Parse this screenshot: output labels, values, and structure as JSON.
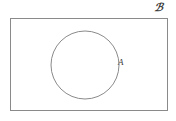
{
  "figure": {
    "type": "venn-diagram",
    "title": "",
    "background_color": "#ffffff",
    "stroke_color": "#8a8a8a",
    "label_color": "#3a3a3a"
  },
  "universe": {
    "name": "universal-set",
    "label": "ℬ",
    "label_plain": "U",
    "shape": "rectangle",
    "x": 10,
    "y": 18,
    "width": 157,
    "height": 92,
    "label_position": "top-right-outside"
  },
  "sets": [
    {
      "name": "set-a",
      "label": "A",
      "shape": "circle",
      "cx": 85,
      "cy": 65,
      "r": 34,
      "label_position": "right-outside",
      "label_x": 118,
      "label_y": 58,
      "filled": false
    }
  ],
  "chart_data": {
    "type": "diagram",
    "subtype": "venn",
    "title": "",
    "regions": [
      {
        "label": "A",
        "shape": "circle",
        "inside_universe": true
      },
      {
        "label": "ℬ",
        "shape": "rectangle",
        "role": "universal set"
      }
    ],
    "annotations": [
      "ℬ",
      "A"
    ],
    "grid": false,
    "legend": "none"
  }
}
